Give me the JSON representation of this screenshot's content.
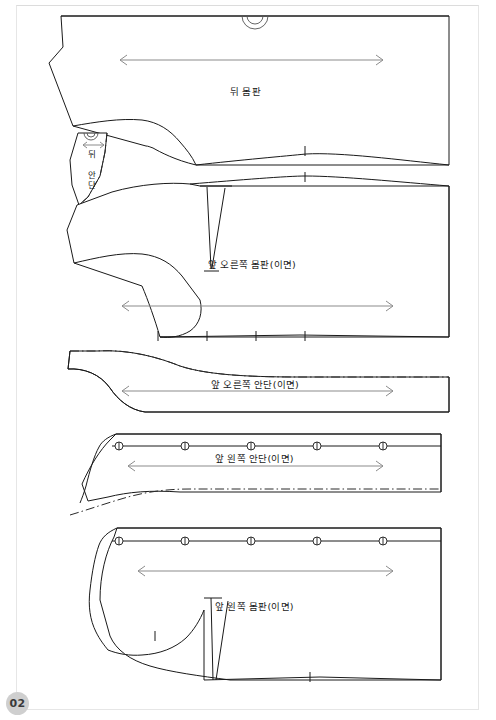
{
  "document": {
    "type": "sewing-pattern-sheet",
    "page_number": "02",
    "footer_text": "",
    "background_color": "#ffffff",
    "line_color": "#1a1a1a",
    "grainline_color": "#8b8b8b",
    "page_badge_color": "#cfcfcf"
  },
  "pieces": [
    {
      "id": "back-body",
      "label": "뒤 몸판",
      "label_x": 255,
      "label_y": 90,
      "has_grainline": true,
      "has_neck_notch": true,
      "notch_count": 2
    },
    {
      "id": "back-facing",
      "label": "뒤 안단",
      "label_x": 92,
      "label_y": 155,
      "orientation": "vertical",
      "has_grainline": true,
      "grainline_style": "short-horizontal",
      "has_neck_notch": true
    },
    {
      "id": "front-right-body",
      "label": "앞 오른쪽 몸판(이면)",
      "label_x": 263,
      "label_y": 263,
      "has_grainline": true,
      "has_dart": true,
      "notch_count": 4
    },
    {
      "id": "front-right-facing",
      "label": "앞 오른쪽 안단(이면)",
      "label_x": 265,
      "label_y": 383,
      "has_grainline": true,
      "has_foldline": true
    },
    {
      "id": "front-left-facing",
      "label": "앞 왼쪽 안단(이면)",
      "label_x": 263,
      "label_y": 457,
      "has_grainline": true,
      "has_foldline": true,
      "buttonhole_count": 5
    },
    {
      "id": "front-left-body",
      "label": "앞 왼쪽 몸판(이면)",
      "label_x": 263,
      "label_y": 605,
      "has_grainline": true,
      "has_dart": true,
      "buttonhole_count": 5,
      "notch_count": 3
    }
  ],
  "markers": {
    "buttonhole_positions_facing": [
      119,
      185,
      251,
      317,
      383
    ],
    "buttonhole_positions_body": [
      119,
      185,
      251,
      317,
      383
    ],
    "buttonhole_label": "buttonhole-marker",
    "grainline_label": "grainline-arrow",
    "foldline_label": "fold-line",
    "notch_label": "notch-mark"
  },
  "grainlines": [
    {
      "piece": "back-body",
      "x1": 120,
      "x2": 383,
      "y": 60
    },
    {
      "piece": "back-facing",
      "x1": 83,
      "x2": 104,
      "y": 145
    },
    {
      "piece": "front-right-body",
      "x1": 122,
      "x2": 393,
      "y": 306
    },
    {
      "piece": "front-right-facing",
      "x1": 122,
      "x2": 393,
      "y": 391
    },
    {
      "piece": "front-left-facing",
      "x1": 128,
      "x2": 383,
      "y": 466
    },
    {
      "piece": "front-left-body",
      "x1": 138,
      "x2": 393,
      "y": 571
    }
  ]
}
